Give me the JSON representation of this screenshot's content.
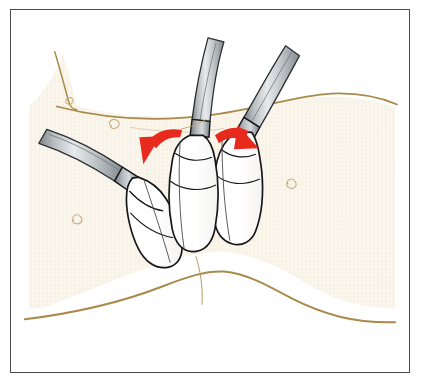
{
  "figure": {
    "caption": "Three laparoscopic instruments inserted through the abdominal wall; red curved arrows show the lateral spreading motion of the outer instruments away from the central one.",
    "frame": {
      "border_color": "#4a4a4f",
      "border_width_px": 1.4,
      "outer_background": "#ffffff"
    },
    "colors": {
      "skin_fill": "#fbf6ec",
      "skin_texture": "#efe6d3",
      "skin_fold_line": "#a98a4b",
      "skin_mark": "#c9b07e",
      "instrument_body": "#ffffff",
      "instrument_outline": "#17171a",
      "shaft_grey_light": "#cfd2d4",
      "shaft_grey_mid": "#9fa5a9",
      "shaft_grey_dark": "#6e7478",
      "arrow_red": "#e8291e",
      "incision_line": "#b59a62"
    },
    "elements": {
      "skin_field_label": "abdominal skin surface",
      "upper_fold_label": "upper skin fold contour",
      "lower_fold_label": "lower skin fold contour",
      "incision_label": "midline incision trace",
      "arrow_left_label": "left lateral motion arrow",
      "arrow_right_label": "right lateral motion arrow"
    },
    "instruments": [
      {
        "id": "instrument-left",
        "label": "left trocar cannula",
        "shaft_angle_deg": -38,
        "tip_x": 163,
        "tip_y": 238
      },
      {
        "id": "instrument-center",
        "label": "center trocar cannula",
        "shaft_angle_deg": -6,
        "tip_x": 196,
        "tip_y": 240
      },
      {
        "id": "instrument-right",
        "label": "right trocar cannula",
        "shaft_angle_deg": 34,
        "tip_x": 228,
        "tip_y": 236
      }
    ],
    "skin_marks": [
      {
        "x": 106,
        "y": 116,
        "rot": -18
      },
      {
        "x": 68,
        "y": 212,
        "rot": 8
      },
      {
        "x": 283,
        "y": 176,
        "rot": 24
      },
      {
        "x": 60,
        "y": 96,
        "rot": -40
      }
    ]
  }
}
